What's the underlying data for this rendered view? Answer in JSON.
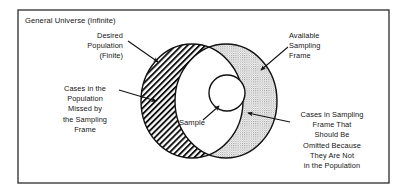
{
  "figure": {
    "frame_label": "General Universe (Infinite)",
    "background_color": "#ffffff",
    "border_color": "#2b2b2b",
    "ink_color": "#151515"
  },
  "labels": {
    "desired_population": {
      "name": "desired-population-label",
      "lines": [
        "Desired",
        "Population",
        "(Finite)"
      ],
      "anchor": "end",
      "x": 123,
      "y": 38,
      "line_height": 10.2
    },
    "available_sampling_frame": {
      "name": "available-sampling-frame-label",
      "lines": [
        "Available",
        "Sampling",
        "Frame"
      ],
      "anchor": "start",
      "x": 289,
      "y": 38,
      "line_height": 10.2
    },
    "cases_missed": {
      "name": "cases-missed-label",
      "lines": [
        "Cases in the",
        "Population",
        "Missed by",
        "the Sampling",
        "Frame"
      ],
      "anchor": "middle",
      "x": 85,
      "y": 91,
      "line_height": 10.2
    },
    "cases_omitted": {
      "name": "cases-omitted-label",
      "lines": [
        "Cases in Sampling",
        "Frame That",
        "Should Be",
        "Omitted Because",
        "They Are Not",
        "in the Population"
      ],
      "anchor": "middle",
      "x": 332,
      "y": 117,
      "line_height": 10.2
    },
    "sample": {
      "name": "sample-label",
      "lines": [
        "Sample"
      ],
      "anchor": "middle",
      "x": 192,
      "y": 125,
      "line_height": 10.2
    }
  },
  "regions": {
    "desired_population": {
      "name": "desired-population-ellipse",
      "fill": "hatch-diagonal",
      "cx": 192,
      "cy": 101,
      "rx": 51,
      "ry": 57
    },
    "available_sampling_frame": {
      "name": "available-sampling-frame-ellipse",
      "fill": "grey-stipple",
      "grey": "#d6d6d6",
      "cx": 226,
      "cy": 101,
      "rx": 51,
      "ry": 57
    },
    "sample": {
      "name": "sample-circle",
      "fill": "#ffffff",
      "cx": 227,
      "cy": 93,
      "r": 18
    }
  },
  "frame_rect": {
    "x": 18,
    "y": 10,
    "width": 371,
    "height": 173
  },
  "arrows": [
    {
      "name": "arrow-desired-population",
      "x1": 128,
      "y1": 41,
      "x2": 158,
      "y2": 62
    },
    {
      "name": "arrow-available-sampling-frame",
      "x1": 288,
      "y1": 47,
      "x2": 261,
      "y2": 70
    },
    {
      "name": "arrow-cases-missed",
      "x1": 119,
      "y1": 90,
      "x2": 156,
      "y2": 101
    },
    {
      "name": "arrow-cases-omitted",
      "x1": 290,
      "y1": 122,
      "x2": 248,
      "y2": 113
    },
    {
      "name": "arrow-sample",
      "x1": 203,
      "y1": 120,
      "x2": 219,
      "y2": 106
    }
  ]
}
